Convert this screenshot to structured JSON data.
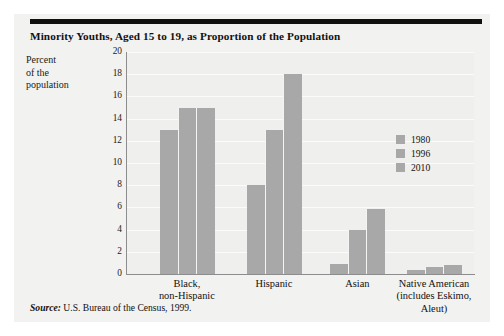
{
  "figure": {
    "title": "Minority Youths, Aged 15 to 19, as Proportion of the Population",
    "source_label": "Source:",
    "source_text": "U.S. Bureau of the Census, 1999.",
    "background_color": "#f2f2f0",
    "rule_color": "#111111",
    "bar_color": "#a8a8a8"
  },
  "chart_data": {
    "type": "bar",
    "title": "Minority Youths, Aged 15 to 19, as Proportion of the Population",
    "xlabel": "",
    "ylabel": "Percent of the population",
    "ylabel_lines": [
      "Percent",
      "of the",
      "population"
    ],
    "categories": [
      "Black, non-Hispanic",
      "Hispanic",
      "Asian",
      "Native American (includes Eskimo, Aleut)"
    ],
    "category_lines": [
      [
        "Black,",
        "non-Hispanic"
      ],
      [
        "Hispanic"
      ],
      [
        "Asian"
      ],
      [
        "Native American",
        "(includes Eskimo,",
        "Aleut)"
      ]
    ],
    "series": [
      {
        "name": "1980",
        "values": [
          13.0,
          8.0,
          0.9,
          0.4
        ],
        "color": "#a8a8a8"
      },
      {
        "name": "1996",
        "values": [
          15.0,
          13.0,
          4.0,
          0.6
        ],
        "color": "#a8a8a8"
      },
      {
        "name": "2010",
        "values": [
          15.0,
          18.0,
          5.9,
          0.8
        ],
        "color": "#a8a8a8"
      }
    ],
    "ylim": [
      0,
      20
    ],
    "yticks": [
      0,
      2,
      4,
      6,
      8,
      10,
      12,
      14,
      16,
      18,
      20
    ],
    "ytick_labels": [
      "0",
      "2",
      "4",
      "6",
      "8",
      "10",
      "12",
      "14",
      "16",
      "18",
      "20"
    ],
    "grid": true,
    "grid_color": "#fbfbfa",
    "legend_position": "right-center",
    "legend_entries": [
      "1980",
      "1996",
      "2010"
    ]
  }
}
